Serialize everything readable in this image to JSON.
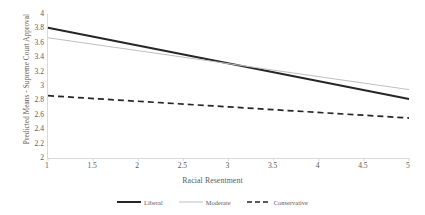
{
  "chart_data": {
    "type": "line",
    "title": "",
    "xlabel": "Racial Resentment",
    "ylabel": "Predicted Means - Supreme Court Approval",
    "xlim": [
      1,
      5
    ],
    "ylim": [
      2,
      4
    ],
    "grid": false,
    "legend_position": "bottom",
    "x_ticks": [
      "1",
      "1.5",
      "2",
      "2.5",
      "3",
      "3.5",
      "4",
      "4.5",
      "5"
    ],
    "x_tick_values": [
      1,
      1.5,
      2,
      2.5,
      3,
      3.5,
      4,
      4.5,
      5
    ],
    "y_ticks": [
      "4",
      "3.8",
      "3.6",
      "3.4",
      "3.2",
      "3",
      "2.8",
      "2.6",
      "2.4",
      "2.2",
      "2"
    ],
    "y_tick_values": [
      4,
      3.8,
      3.6,
      3.4,
      3.2,
      3,
      2.8,
      2.6,
      2.4,
      2.2,
      2
    ],
    "x": [
      1,
      5
    ],
    "series": [
      {
        "name": "Liberal",
        "values": [
          3.81,
          2.82
        ],
        "color": "#262626",
        "style": "solid",
        "width": 2.0
      },
      {
        "name": "Moderate",
        "values": [
          3.67,
          2.95
        ],
        "color": "#bfbfbf",
        "style": "solid",
        "width": 1.0
      },
      {
        "name": "Conservative",
        "values": [
          2.865,
          2.555
        ],
        "color": "#262626",
        "style": "dashed",
        "width": 1.7
      }
    ]
  },
  "legend": {
    "items": [
      {
        "label": "Liberal"
      },
      {
        "label": "Moderate"
      },
      {
        "label": "Conservative"
      }
    ]
  },
  "axes": {
    "line_color": "#d9d9d9",
    "text_color": "#5a5a5a"
  }
}
